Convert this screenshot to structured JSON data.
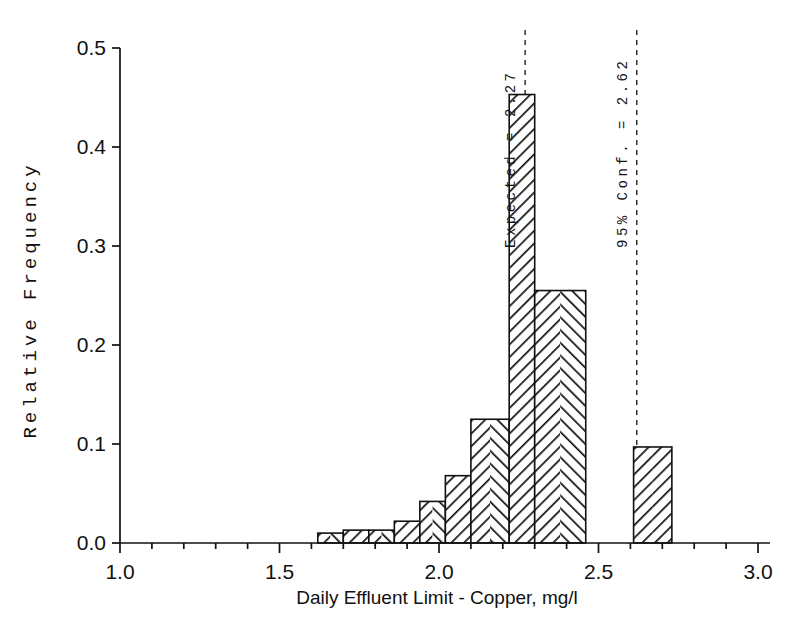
{
  "chart_data": {
    "type": "bar",
    "title": "",
    "subtitle": "",
    "xlabel": "Daily Effluent Limit - Copper, mg/l",
    "ylabel": "Relative Frequency",
    "xlim": [
      1.0,
      3.0
    ],
    "ylim": [
      0.0,
      0.5
    ],
    "grid": false,
    "legend": null,
    "xticks": [
      "1.0",
      "1.5",
      "2.0",
      "2.5",
      "3.0"
    ],
    "xtick_values": [
      1.0,
      1.5,
      2.0,
      2.5,
      3.0
    ],
    "yticks": [
      "0.0",
      "0.1",
      "0.2",
      "0.3",
      "0.4",
      "0.5"
    ],
    "ytick_values": [
      0.0,
      0.1,
      0.2,
      0.3,
      0.4,
      0.5
    ],
    "x_minor_tick_step": 0.1,
    "bin_edges": [
      1.62,
      1.7,
      1.78,
      1.86,
      1.94,
      2.02,
      2.1,
      2.22,
      2.3,
      2.46,
      2.61,
      2.73
    ],
    "bars": [
      {
        "x0": 1.62,
        "x1": 1.7,
        "value": 0.01
      },
      {
        "x0": 1.7,
        "x1": 1.78,
        "value": 0.013
      },
      {
        "x0": 1.78,
        "x1": 1.86,
        "value": 0.013
      },
      {
        "x0": 1.86,
        "x1": 1.94,
        "value": 0.022
      },
      {
        "x0": 1.94,
        "x1": 2.02,
        "value": 0.042
      },
      {
        "x0": 2.02,
        "x1": 2.1,
        "value": 0.068
      },
      {
        "x0": 2.1,
        "x1": 2.22,
        "value": 0.125
      },
      {
        "x0": 2.22,
        "x1": 2.3,
        "value": 0.453
      },
      {
        "x0": 2.3,
        "x1": 2.46,
        "value": 0.255
      },
      {
        "x0": 2.61,
        "x1": 2.73,
        "value": 0.097
      }
    ],
    "values": [
      0.01,
      0.013,
      0.013,
      0.022,
      0.042,
      0.068,
      0.125,
      0.453,
      0.255,
      0.097
    ],
    "categories": [
      "1.62-1.70",
      "1.70-1.78",
      "1.78-1.86",
      "1.86-1.94",
      "1.94-2.02",
      "2.02-2.10",
      "2.10-2.22",
      "2.22-2.30",
      "2.30-2.46",
      "2.61-2.73"
    ],
    "annotations": [
      {
        "id": "expected",
        "label": "Expected = 2.27",
        "x": 2.27,
        "style": "dashed-vertical"
      },
      {
        "id": "conf95",
        "label": "95% Conf. = 2.62",
        "x": 2.62,
        "style": "dashed-vertical"
      }
    ],
    "bar_fill": "#ffffff",
    "bar_edge": "#111111",
    "hatch": "herringbone",
    "axis_color": "#111111"
  }
}
